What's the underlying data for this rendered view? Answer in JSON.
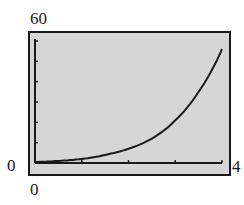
{
  "chart_data": {
    "type": "line",
    "title": "",
    "xlabel": "",
    "ylabel": "",
    "xlim": [
      0,
      4
    ],
    "ylim": [
      0,
      60
    ],
    "x_tick_labels": [
      "0",
      "4"
    ],
    "y_tick_labels": [
      "0",
      "60"
    ],
    "x_ticks": [
      0,
      1,
      2,
      3,
      4
    ],
    "y_ticks": [
      0,
      10,
      20,
      30,
      40,
      50,
      60
    ],
    "grid": false,
    "legend": null,
    "series": [
      {
        "name": "curve",
        "x": [
          0,
          0.5,
          1,
          1.5,
          2,
          2.5,
          3,
          3.5,
          4
        ],
        "values": [
          0.5,
          1,
          2,
          4,
          7,
          12,
          21,
          35,
          56
        ]
      }
    ],
    "style": "graphing calculator viewing window"
  },
  "labels": {
    "y_max": "60",
    "y_min": "0",
    "x_min": "0",
    "x_max": "4"
  },
  "colors": {
    "screen_bg": "#d6d6d6",
    "frame": "#1a1a1a",
    "curve": "#1a1a1a"
  }
}
